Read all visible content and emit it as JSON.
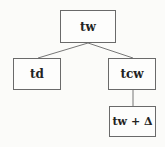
{
  "diagram": {
    "type": "tree",
    "nodes": [
      {
        "id": "root",
        "label": "tw"
      },
      {
        "id": "left",
        "label": "td"
      },
      {
        "id": "right",
        "label": "tcw"
      },
      {
        "id": "right-child",
        "label": "tw + Δ"
      }
    ],
    "edges": [
      {
        "from": "root",
        "to": "left"
      },
      {
        "from": "root",
        "to": "right"
      },
      {
        "from": "right",
        "to": "right-child"
      }
    ],
    "colors": {
      "border": "#6a6a6a",
      "text": "#222222",
      "background": "#fbfbf9"
    }
  }
}
